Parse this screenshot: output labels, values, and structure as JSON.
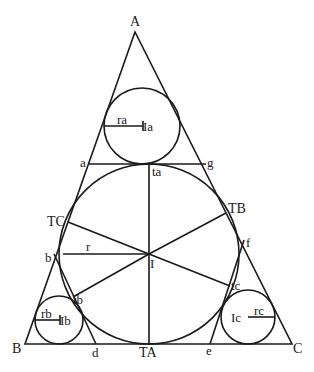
{
  "diagram": {
    "stroke_color": "#1a1a1a",
    "background": "#ffffff",
    "vertices": {
      "A": {
        "label": "A",
        "x": 135,
        "y": 32
      },
      "B": {
        "label": "B",
        "x": 25,
        "y": 344
      },
      "C": {
        "label": "C",
        "x": 292,
        "y": 344
      }
    },
    "incircle": {
      "center_label": "I",
      "radius_label": "r",
      "cx": 149,
      "cy": 254,
      "r": 90
    },
    "corner_circles": {
      "a": {
        "center_label": "Ia",
        "radius_label": "ra",
        "cx": 142,
        "cy": 126,
        "r": 38
      },
      "b": {
        "center_label": "Ib",
        "radius_label": "rb",
        "cx": 59,
        "cy": 320,
        "r": 24
      },
      "c": {
        "center_label": "Ic",
        "radius_label": "rc",
        "cx": 248,
        "cy": 317,
        "r": 27
      }
    },
    "points": {
      "TA": {
        "label": "TA"
      },
      "TB": {
        "label": "TB"
      },
      "TC": {
        "label": "TC"
      },
      "ta": {
        "label": "ta"
      },
      "tb": {
        "label": "tb"
      },
      "tc": {
        "label": "tc"
      },
      "a": {
        "label": "a"
      },
      "b": {
        "label": "b"
      },
      "d": {
        "label": "d"
      },
      "e": {
        "label": "e"
      },
      "f": {
        "label": "f"
      },
      "g": {
        "label": "g"
      }
    },
    "tangent_segments": [
      {
        "from": "a",
        "to": "g"
      },
      {
        "from": "b",
        "to": "d"
      },
      {
        "from": "e",
        "to": "f"
      }
    ],
    "radii_from_I": [
      "ta",
      "TA",
      "TB",
      "TC",
      "tb",
      "tc"
    ]
  }
}
